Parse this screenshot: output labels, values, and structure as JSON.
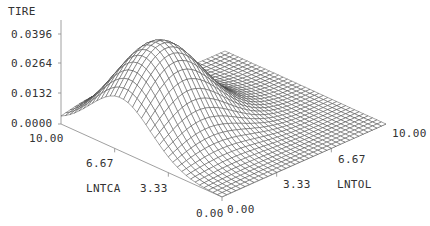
{
  "chart_data": {
    "type": "surface3d",
    "title": "",
    "zlabel": "TIRE",
    "xlabel": "LNTCA",
    "ylabel": "LNTOL",
    "zticks": [
      "0.0000",
      "0.0132",
      "0.0264",
      "0.0396"
    ],
    "zlim": [
      0.0,
      0.0396
    ],
    "xticks": [
      "10.00",
      "6.67",
      "3.33",
      "0.00"
    ],
    "yticks": [
      "0.00",
      "3.33",
      "6.67",
      "10.00"
    ],
    "xlim": [
      0.0,
      10.0
    ],
    "ylim": [
      0.0,
      10.0
    ],
    "surface": {
      "description": "Single-peaked bivariate bell surface; peak ~0.040 near LNTCA~6.3, LNTOL~2.5; decays toward 0 as LNTOL -> 10 and at LNTCA edges",
      "peak_z": 0.0405,
      "peak_x": 6.3,
      "peak_y": 2.3,
      "sigma_x": 1.9,
      "sigma_y": 2.2,
      "grid_n": 36
    },
    "grid": false,
    "wireframe_color": "#3a3a3a"
  },
  "labels": {
    "z_title": "TIRE",
    "z_0": "0.0000",
    "z_1": "0.0132",
    "z_2": "0.0264",
    "z_3": "0.0396",
    "x_10": "10.00",
    "x_667": "6.67",
    "x_333": "3.33",
    "x_0": "0.00",
    "y_0": "0.00",
    "y_333": "3.33",
    "y_667": "6.67",
    "y_10": "10.00",
    "x_title": "LNTCA",
    "y_title": "LNTOL"
  }
}
